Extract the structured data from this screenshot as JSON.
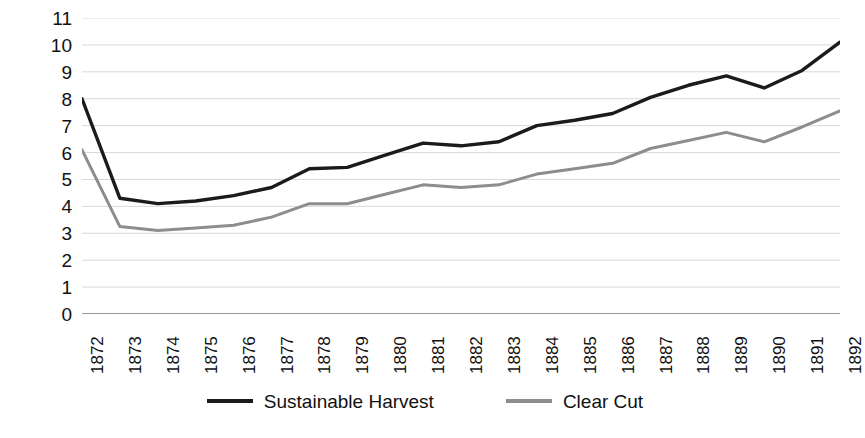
{
  "chart_data": {
    "type": "line",
    "title": "",
    "xlabel": "",
    "ylabel": "Thousands of km",
    "ylabel_superscript": "2",
    "ylim": [
      0,
      11
    ],
    "ytick_step": 1,
    "grid": true,
    "grid_axis": "y",
    "legend_position": "bottom",
    "categories": [
      "1872",
      "1873",
      "1874",
      "1875",
      "1876",
      "1877",
      "1878",
      "1879",
      "1880",
      "1881",
      "1882",
      "1883",
      "1884",
      "1885",
      "1886",
      "1887",
      "1888",
      "1889",
      "1890",
      "1891",
      "1892"
    ],
    "ytick_labels": [
      "11",
      "10",
      "9",
      "8",
      "7",
      "6",
      "5",
      "4",
      "3",
      "2",
      "1",
      "0"
    ],
    "series": [
      {
        "name": "Sustainable Harvest",
        "color": "#1b1b1b",
        "values": [
          8.0,
          4.3,
          4.1,
          4.2,
          4.4,
          4.7,
          5.4,
          5.45,
          5.9,
          6.35,
          6.25,
          6.4,
          7.0,
          7.2,
          7.45,
          8.05,
          8.5,
          8.85,
          8.4,
          9.05,
          10.1
        ]
      },
      {
        "name": "Clear Cut",
        "color": "#8d8d8d",
        "values": [
          6.1,
          3.25,
          3.1,
          3.2,
          3.3,
          3.6,
          4.1,
          4.1,
          4.45,
          4.8,
          4.7,
          4.8,
          5.2,
          5.4,
          5.6,
          6.15,
          6.45,
          6.75,
          6.4,
          6.95,
          7.55
        ]
      }
    ]
  },
  "legend": {
    "items": [
      {
        "label": "Sustainable Harvest"
      },
      {
        "label": "Clear Cut"
      }
    ]
  },
  "style": {
    "background": "#ffffff",
    "gridline_color": "#d8d8d8",
    "axis_color": "#7a7a7a",
    "text_color": "#111111"
  }
}
